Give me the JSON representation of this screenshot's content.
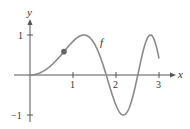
{
  "chart_data": {
    "type": "line",
    "title": "",
    "xlabel": "x",
    "ylabel": "y",
    "function_label": "f",
    "function_expression": "sin(x^2)",
    "xlim": [
      0,
      3.2
    ],
    "ylim": [
      -1,
      1
    ],
    "x_ticks": [
      1,
      2,
      3
    ],
    "x_tick_labels": [
      "1",
      "2",
      "3"
    ],
    "y_ticks": [
      1,
      -1
    ],
    "y_tick_labels": [
      "1",
      "−1"
    ],
    "grid": false,
    "series": [
      {
        "name": "f",
        "x": [
          0,
          0.25,
          0.5,
          0.75,
          1.0,
          1.25,
          1.5,
          1.77,
          2.0,
          2.17,
          2.35,
          2.51,
          2.65,
          2.8,
          2.9,
          3.0
        ],
        "values": [
          0,
          0.06,
          0.25,
          0.53,
          0.84,
          1.0,
          0.78,
          0.0,
          -0.76,
          -1.0,
          -0.69,
          0.0,
          0.66,
          1.0,
          0.86,
          0.41
        ]
      }
    ],
    "marked_point": {
      "x": 0.79,
      "y": 0.58
    },
    "colors": {
      "curve": "#8a8a8a",
      "axes": "#555555",
      "point": "#666666"
    }
  }
}
